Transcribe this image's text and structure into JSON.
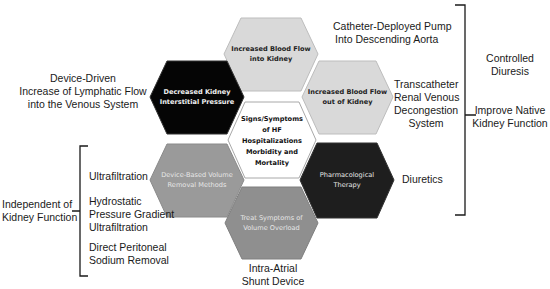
{
  "hexagons": {
    "top": {
      "lines": [
        "Increased Blood Flow",
        "into Kidney"
      ],
      "fill": "#d9d9d9",
      "text_color": "#222222"
    },
    "upper_left": {
      "lines": [
        "Decreased Kidney",
        "Interstitial Pressure"
      ],
      "fill": "#050505",
      "text_color": "#f0f0f0"
    },
    "upper_right": {
      "lines": [
        "Increased Blood Flow",
        "out of Kidney"
      ],
      "fill": "#d9d9d9",
      "text_color": "#222222"
    },
    "center": {
      "lines": [
        "Signs/Symptoms",
        "of HF",
        "Hospitalizations",
        "Morbidity and",
        "Mortality"
      ],
      "fill": "#ffffff",
      "text_color": "#111111"
    },
    "lower_left": {
      "lines": [
        "Device-Based Volume",
        "Removal Methods"
      ],
      "fill": "#9a9a9a",
      "text_color": "#e6e6e6"
    },
    "lower_right": {
      "lines": [
        "Pharmacological",
        "Therapy"
      ],
      "fill": "#1e1e1e",
      "text_color": "#e6e6e6"
    },
    "bottom": {
      "lines": [
        "Treat Symptoms of",
        "Volume Overload"
      ],
      "fill": "#8f8f8f",
      "text_color": "#e6e6e6"
    }
  },
  "labels": {
    "catheter_pump": [
      "Catheter-Deployed Pump",
      "Into Descending Aorta"
    ],
    "lymphatic": [
      "Device-Driven",
      "Increase of Lymphatic Flow",
      "into the Venous System"
    ],
    "transcatheter": [
      "Transcatheter",
      "Renal Venous",
      "Decongestion",
      "System"
    ],
    "diuretics": [
      "Diuretics"
    ],
    "intra_atrial": [
      "Intra-Atrial",
      "Shunt Device"
    ],
    "ultrafiltration": [
      "Ultrafiltration"
    ],
    "hydrostatic": [
      "Hydrostatic",
      "Pressure Gradient",
      "Ultrafiltration"
    ],
    "peritoneal": [
      "Direct Peritoneal",
      "Sodium Removal"
    ],
    "independent": [
      "Independent of",
      "Kidney Function"
    ],
    "controlled_diuresis": [
      "Controlled",
      "Diuresis"
    ],
    "improve_native": [
      "Improve Native",
      "Kidney Function"
    ]
  },
  "colors": {
    "bracket": "#1a1a1a",
    "hex_border": "#b0b0b0"
  }
}
